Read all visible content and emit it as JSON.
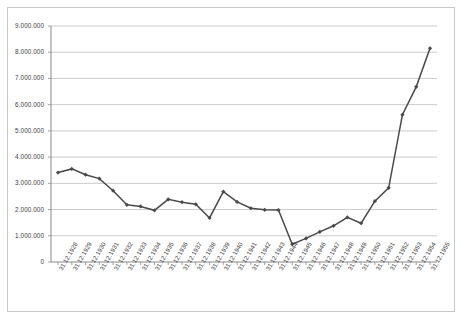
{
  "chart_data": {
    "type": "line",
    "title": "",
    "xlabel": "",
    "ylabel": "",
    "ylim": [
      0,
      9000000
    ],
    "ytick_step": 1000000,
    "grid": true,
    "legend": false,
    "line_color": "#4a4a4a",
    "marker": "diamond",
    "categories": [
      "31.12.1928",
      "31.12.1929",
      "31.12.1930",
      "31.12.1931",
      "31.12.1932",
      "31.12.1933",
      "31.12.1934",
      "31.12.1935",
      "31.12.1936",
      "31.12.1937",
      "31.12.1938",
      "31.12.1939",
      "31.12.1940",
      "31.12.1941",
      "31.12.1942",
      "31.12.1943",
      "31.12.1944",
      "31.12.1945",
      "31.12.1946",
      "31.12.1947",
      "31.12.1948",
      "31.12.1949",
      "31.12.1950",
      "31.12.1951",
      "31.12.1952",
      "31.12.1953",
      "31.12.1954",
      "31.12.1955"
    ],
    "values": [
      3410000,
      3550000,
      3330000,
      3180000,
      2720000,
      2180000,
      2120000,
      1970000,
      2390000,
      2280000,
      2200000,
      1680000,
      2680000,
      2290000,
      2050000,
      1990000,
      1980000,
      680000,
      900000,
      1150000,
      1380000,
      1700000,
      1480000,
      2320000,
      2830000,
      5620000,
      6680000,
      8150000
    ],
    "ytick_labels": [
      "9.000.000",
      "8.000.000",
      "7.000.000",
      "6.000.000",
      "5.000.000",
      "4.000.000",
      "3.000.000",
      "2.000.000",
      "1.000.000",
      "0"
    ]
  }
}
